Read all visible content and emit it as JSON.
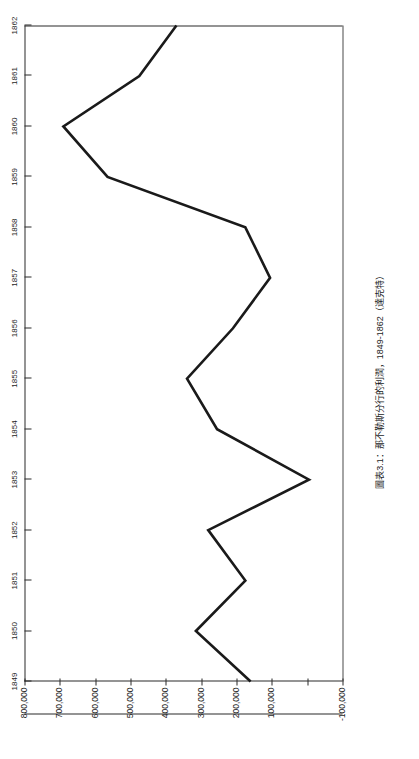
{
  "chart_data": {
    "type": "line",
    "title": "圖表3.1：那不勒斯分行的利潤，1849-1862（達克特）",
    "xlabel": "",
    "ylabel": "",
    "grid": false,
    "legend": "none",
    "orientation": "page-rotated-90-ccw",
    "categories": [
      "1849",
      "1850",
      "1851",
      "1852",
      "1853",
      "1854",
      "1855",
      "1856",
      "1857",
      "1858",
      "1859",
      "1860",
      "1861",
      "1862"
    ],
    "values": [
      160000,
      315000,
      175000,
      280000,
      -5000,
      255000,
      340000,
      210000,
      105000,
      175000,
      565000,
      690000,
      475000,
      370000
    ],
    "series": [
      {
        "name": "那不勒斯分行的利潤",
        "values": [
          160000,
          315000,
          175000,
          280000,
          -5000,
          255000,
          340000,
          210000,
          105000,
          175000,
          565000,
          690000,
          475000,
          370000
        ]
      }
    ],
    "ylim": [
      -100000,
      800000
    ],
    "ytick_labels": [
      "-100,000",
      "",
      "100,000",
      "200,000",
      "300,000",
      "400,000",
      "500,000",
      "600,000",
      "700,000",
      "800,000"
    ],
    "ytick_values": [
      -100000,
      0,
      100000,
      200000,
      300000,
      400000,
      500000,
      600000,
      700000,
      800000
    ],
    "line_color": "#1a1a1a",
    "frame_color": "#2b2b2b",
    "background_color": "#ffffff"
  }
}
